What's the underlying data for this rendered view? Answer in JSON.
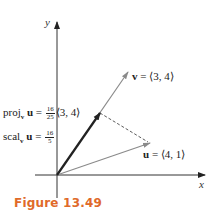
{
  "figure": {
    "caption": "Figure 13.49",
    "caption_color": "#e06a2a"
  },
  "axes": {
    "x_label": "x",
    "y_label": "y"
  },
  "vectors": {
    "v": {
      "name": "v",
      "label": "= ⟨3, 4⟩",
      "components": [
        3,
        4
      ],
      "color": "#8a8a8a"
    },
    "u": {
      "name": "u",
      "label": "= ⟨4, 1⟩",
      "components": [
        4,
        1
      ],
      "color": "#8a8a8a"
    },
    "proj": {
      "prefix": "proj",
      "subscript": "v",
      "vec": "u",
      "eq": "=",
      "num": "16",
      "den": "25",
      "tail": "⟨3, 4⟩",
      "color": "#222222"
    },
    "scal": {
      "prefix": "scal",
      "subscript": "v",
      "vec": "u",
      "eq": "=",
      "num": "16",
      "den": "5"
    }
  }
}
